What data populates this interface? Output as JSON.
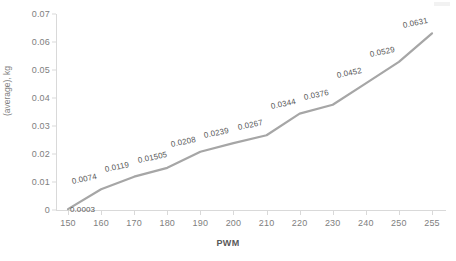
{
  "chart_data": {
    "type": "line",
    "title": "",
    "xlabel": "PWM",
    "ylabel": "(average), kg",
    "x": [
      150,
      160,
      170,
      180,
      190,
      200,
      210,
      220,
      230,
      240,
      250,
      255
    ],
    "values": [
      0.0003,
      0.0074,
      0.0119,
      0.01505,
      0.0208,
      0.0239,
      0.0267,
      0.0344,
      0.0376,
      0.0452,
      0.0529,
      0.0631
    ],
    "point_labels": [
      "0.0003",
      "0.0074",
      "0.0119",
      "0.01505",
      "0.0208",
      "0.0239",
      "0.0267",
      "0.0344",
      "0.0376",
      "0.0452",
      "0.0529",
      "0.0631"
    ],
    "xtick_labels": [
      "150",
      "160",
      "170",
      "180",
      "190",
      "200",
      "210",
      "220",
      "230",
      "240",
      "250",
      "255"
    ],
    "ytick_labels": [
      "0",
      "0.01",
      "0.02",
      "0.03",
      "0.04",
      "0.05",
      "0.06",
      "0.07"
    ],
    "ytick_values": [
      0,
      0.01,
      0.02,
      0.03,
      0.04,
      0.05,
      0.06,
      0.07
    ],
    "ylim": [
      0,
      0.07
    ],
    "grid": false,
    "legend": false,
    "series_color": "#a6a6a6",
    "axis_color": "#d9d9d9",
    "text_color": "#808080"
  }
}
